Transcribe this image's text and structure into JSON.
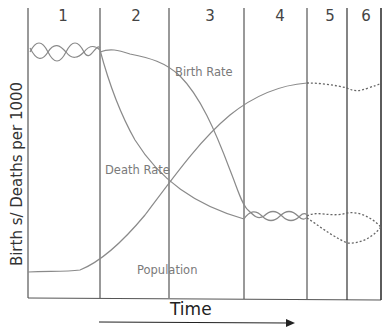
{
  "diagram": {
    "y_axis_label": "Birth s/ Deaths per 1000",
    "x_axis_label": "Time",
    "stages": [
      {
        "number": "1",
        "x_center": 63
      },
      {
        "number": "2",
        "x_center": 136
      },
      {
        "number": "3",
        "x_center": 210
      },
      {
        "number": "4",
        "x_center": 280
      },
      {
        "number": "5",
        "x_center": 330
      },
      {
        "number": "6",
        "x_center": 366
      }
    ],
    "curve_labels": {
      "birth_rate": "Birth Rate",
      "death_rate": "Death Rate",
      "population": "Population"
    },
    "colors": {
      "frame": "#444444",
      "curves": "#8a8a8a",
      "dotted_future": "#555555",
      "labels": "#7a7a7a"
    },
    "arrow": {
      "direction": "right",
      "meaning": "time progresses"
    }
  }
}
